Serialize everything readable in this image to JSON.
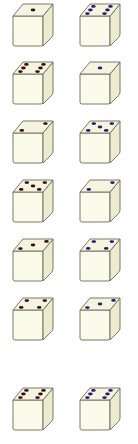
{
  "colors": {
    "face_front": "#fbfbec",
    "face_top": "#f4f4e0",
    "face_side": "#ecebcf",
    "outline": "#6b6b5a",
    "pip_left": "#3a0d14",
    "pip_right": "#2e1a6b"
  },
  "dice": [
    {
      "row": 1,
      "col": "left",
      "value": 1,
      "x": 11,
      "y": 2
    },
    {
      "row": 1,
      "col": "right",
      "value": 6,
      "x": 78,
      "y": 2
    },
    {
      "row": 2,
      "col": "left",
      "value": 6,
      "x": 11,
      "y": 60
    },
    {
      "row": 2,
      "col": "right",
      "value": 1,
      "x": 78,
      "y": 60
    },
    {
      "row": 3,
      "col": "left",
      "value": 2,
      "x": 11,
      "y": 119
    },
    {
      "row": 3,
      "col": "right",
      "value": 5,
      "x": 78,
      "y": 119
    },
    {
      "row": 4,
      "col": "left",
      "value": 5,
      "x": 11,
      "y": 178
    },
    {
      "row": 4,
      "col": "right",
      "value": 2,
      "x": 78,
      "y": 178
    },
    {
      "row": 5,
      "col": "left",
      "value": 3,
      "x": 11,
      "y": 237
    },
    {
      "row": 5,
      "col": "right",
      "value": 4,
      "x": 78,
      "y": 237
    },
    {
      "row": 6,
      "col": "left",
      "value": 4,
      "x": 11,
      "y": 296
    },
    {
      "row": 6,
      "col": "right",
      "value": 3,
      "x": 78,
      "y": 296
    },
    {
      "row": 7,
      "col": "left",
      "value": 6,
      "x": 11,
      "y": 386
    },
    {
      "row": 7,
      "col": "right",
      "value": 6,
      "x": 78,
      "y": 386
    }
  ]
}
